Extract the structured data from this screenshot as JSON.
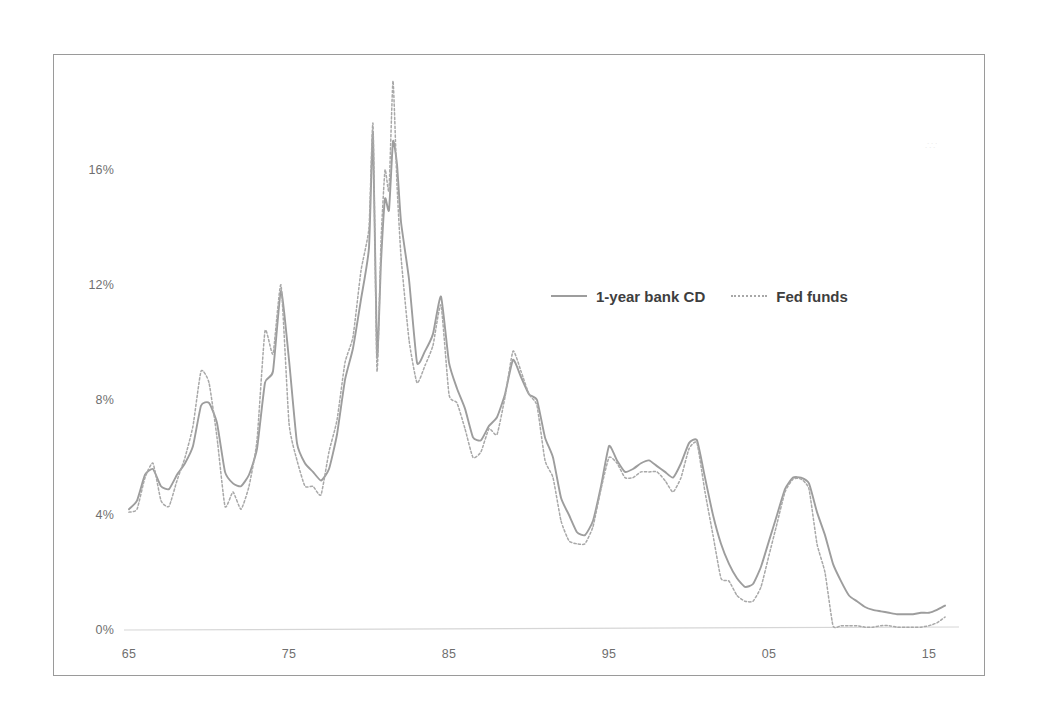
{
  "figure": {
    "background_color": "#ffffff",
    "border_color": "#9a9a9a",
    "artifact_text": "∴∵"
  },
  "legend": {
    "position": "inside-top-right",
    "entries": [
      {
        "label": "1-year bank CD",
        "style": "solid",
        "color": "#9d9d9d",
        "icon": "solid-line-swatch"
      },
      {
        "label": "Fed funds",
        "style": "dotted",
        "color": "#a8a8a8",
        "icon": "dotted-line-swatch"
      }
    ]
  },
  "axes": {
    "y_ticks": [
      "0%",
      "4%",
      "8%",
      "12%",
      "16%"
    ],
    "x_ticks": [
      "65",
      "75",
      "85",
      "95",
      "05",
      "15"
    ]
  },
  "chart_data": {
    "type": "line",
    "title": "",
    "subtitle": "",
    "xlabel": "",
    "ylabel": "",
    "xlim": [
      1964.5,
      2016.5
    ],
    "ylim": [
      0,
      20
    ],
    "grid": false,
    "legend_position": "inside-top-right",
    "y_tick_values": [
      0,
      4,
      8,
      12,
      16
    ],
    "y_tick_labels": [
      "0%",
      "4%",
      "8%",
      "12%",
      "16%"
    ],
    "x_tick_values": [
      1965,
      1975,
      1985,
      1995,
      2005,
      2015
    ],
    "x_tick_labels": [
      "65",
      "75",
      "85",
      "95",
      "05",
      "15"
    ],
    "x": [
      1965.0,
      1965.5,
      1966.0,
      1966.5,
      1967.0,
      1967.5,
      1968.0,
      1968.5,
      1969.0,
      1969.5,
      1970.0,
      1970.5,
      1971.0,
      1971.5,
      1972.0,
      1972.5,
      1973.0,
      1973.5,
      1974.0,
      1974.5,
      1975.0,
      1975.5,
      1976.0,
      1976.5,
      1977.0,
      1977.5,
      1978.0,
      1978.5,
      1979.0,
      1979.5,
      1980.0,
      1980.25,
      1980.5,
      1980.75,
      1981.0,
      1981.25,
      1981.5,
      1981.75,
      1982.0,
      1982.5,
      1983.0,
      1983.5,
      1984.0,
      1984.5,
      1985.0,
      1985.5,
      1986.0,
      1986.5,
      1987.0,
      1987.5,
      1988.0,
      1988.5,
      1989.0,
      1989.5,
      1990.0,
      1990.5,
      1991.0,
      1991.5,
      1992.0,
      1992.5,
      1993.0,
      1993.5,
      1994.0,
      1994.5,
      1995.0,
      1995.5,
      1996.0,
      1996.5,
      1997.0,
      1997.5,
      1998.0,
      1998.5,
      1999.0,
      1999.5,
      2000.0,
      2000.5,
      2001.0,
      2001.5,
      2002.0,
      2002.5,
      2003.0,
      2003.5,
      2004.0,
      2004.5,
      2005.0,
      2005.5,
      2006.0,
      2006.5,
      2007.0,
      2007.5,
      2008.0,
      2008.5,
      2009.0,
      2009.5,
      2010.0,
      2010.5,
      2011.0,
      2011.5,
      2012.0,
      2012.5,
      2013.0,
      2013.5,
      2014.0,
      2014.5,
      2015.0,
      2015.5,
      2016.0
    ],
    "series": [
      {
        "name": "1-year bank CD",
        "style": "solid",
        "color": "#9d9d9d",
        "values": [
          4.2,
          4.5,
          5.4,
          5.6,
          5.0,
          4.9,
          5.4,
          5.8,
          6.4,
          7.8,
          7.9,
          7.2,
          5.5,
          5.1,
          5.0,
          5.4,
          6.3,
          8.6,
          9.0,
          11.8,
          9.4,
          6.5,
          5.8,
          5.5,
          5.2,
          5.6,
          6.8,
          8.7,
          9.8,
          11.5,
          13.3,
          17.3,
          9.5,
          12.8,
          15.0,
          14.6,
          17.0,
          16.2,
          14.2,
          12.2,
          9.3,
          9.7,
          10.3,
          11.6,
          9.3,
          8.4,
          7.7,
          6.7,
          6.6,
          7.1,
          7.4,
          8.2,
          9.4,
          8.8,
          8.2,
          8.0,
          6.7,
          6.0,
          4.6,
          4.0,
          3.4,
          3.3,
          3.8,
          5.0,
          6.4,
          5.9,
          5.5,
          5.6,
          5.8,
          5.9,
          5.7,
          5.5,
          5.3,
          5.8,
          6.5,
          6.6,
          5.3,
          4.0,
          3.0,
          2.3,
          1.8,
          1.5,
          1.6,
          2.2,
          3.1,
          4.0,
          4.9,
          5.3,
          5.3,
          5.1,
          4.1,
          3.3,
          2.3,
          1.7,
          1.2,
          1.0,
          0.8,
          0.7,
          0.65,
          0.6,
          0.55,
          0.55,
          0.55,
          0.6,
          0.6,
          0.7,
          0.85
        ]
      },
      {
        "name": "Fed funds",
        "style": "dotted",
        "color": "#a8a8a8",
        "values": [
          4.1,
          4.2,
          5.3,
          5.8,
          4.5,
          4.3,
          5.2,
          6.0,
          7.1,
          9.0,
          8.6,
          6.7,
          4.3,
          4.8,
          4.2,
          5.0,
          6.6,
          10.4,
          9.6,
          12.0,
          7.2,
          5.9,
          5.0,
          5.0,
          4.7,
          6.2,
          7.3,
          9.3,
          10.2,
          12.5,
          14.0,
          17.6,
          9.0,
          13.5,
          16.0,
          15.3,
          19.1,
          15.5,
          13.0,
          10.1,
          8.6,
          9.2,
          9.9,
          11.3,
          8.2,
          7.9,
          7.0,
          6.0,
          6.2,
          7.0,
          6.8,
          8.1,
          9.7,
          9.0,
          8.2,
          7.8,
          5.9,
          5.3,
          3.8,
          3.1,
          3.0,
          3.0,
          3.6,
          4.9,
          6.0,
          5.8,
          5.3,
          5.3,
          5.5,
          5.5,
          5.5,
          5.2,
          4.8,
          5.3,
          6.3,
          6.5,
          4.8,
          3.3,
          1.8,
          1.7,
          1.2,
          1.0,
          1.0,
          1.5,
          2.6,
          3.7,
          4.8,
          5.25,
          5.25,
          4.9,
          3.0,
          2.0,
          0.15,
          0.15,
          0.15,
          0.15,
          0.1,
          0.1,
          0.15,
          0.15,
          0.1,
          0.1,
          0.1,
          0.1,
          0.15,
          0.25,
          0.45
        ]
      }
    ]
  }
}
